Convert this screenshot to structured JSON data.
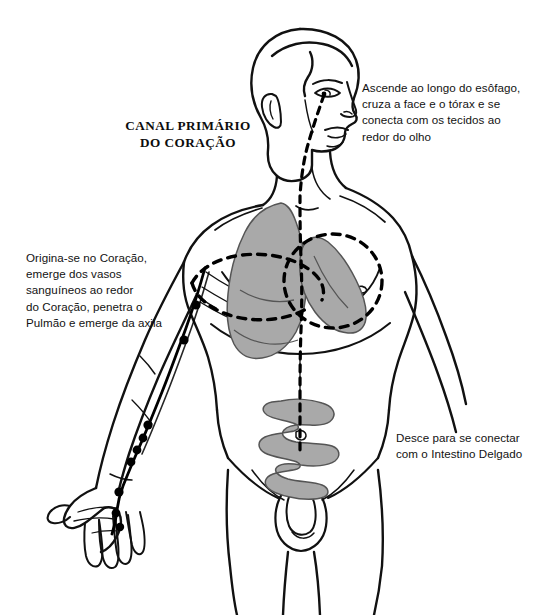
{
  "figure": {
    "title": "CANAL PRIMÁRIO\nDO CORAÇÃO",
    "language": "pt-BR"
  },
  "annotations": {
    "esophagus": "Ascende ao longo do esôfago,\ncruza a face e o tórax e se\nconecta com os tecidos ao\nredor do olho",
    "heart_origin": "Origina-se no Coração,\nemerge dos vasos\nsanguíneos ao redor\ndo Coração, penetra o\nPulmão e emerge da axila",
    "intestine": "Desce para se conectar\ncom o Intestino Delgado"
  },
  "organs": [
    {
      "name": "lung",
      "label": "Pulmão",
      "fill": "#a9a9a9"
    },
    {
      "name": "heart",
      "label": "Coração",
      "fill": "#a9a9a9"
    },
    {
      "name": "small-intestine",
      "label": "Intestino Delgado",
      "fill": "#a9a9a9"
    }
  ],
  "colors": {
    "background": "#ffffff",
    "outline": "#111111",
    "organ_fill": "#a9a9a9",
    "organ_stroke": "#4a4a4a",
    "meridian": "#000000",
    "dashed_path": "#000000",
    "text": "#121212"
  },
  "acupoints": {
    "count": 9,
    "fill": "#000000"
  },
  "paths": {
    "dashed_internal_label": "internal-branch-dashed",
    "meridian_label": "heart-meridian-external-arm-branch"
  }
}
